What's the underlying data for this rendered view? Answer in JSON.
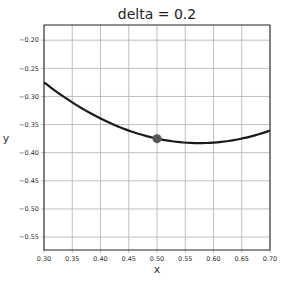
{
  "chart_data": {
    "type": "line",
    "title": "delta = 0.2",
    "xlabel": "x",
    "ylabel": "y",
    "xlim": [
      0.3,
      0.7
    ],
    "ylim": [
      -0.573,
      -0.173
    ],
    "grid": true,
    "xticks": [
      "0.30",
      "0.35",
      "0.40",
      "0.45",
      "0.50",
      "0.55",
      "0.60",
      "0.65",
      "0.70"
    ],
    "yticks": [
      "-0.20",
      "-0.25",
      "-0.30",
      "-0.35",
      "-0.40",
      "-0.45",
      "-0.50",
      "-0.55"
    ],
    "series": [
      {
        "name": "curve",
        "color": "#1a1a1a",
        "x": [
          0.3,
          0.35,
          0.4,
          0.45,
          0.5,
          0.55,
          0.575,
          0.6,
          0.65,
          0.7
        ],
        "y": [
          -0.275,
          -0.309,
          -0.339,
          -0.36,
          -0.375,
          -0.382,
          -0.383,
          -0.382,
          -0.375,
          -0.359
        ]
      }
    ],
    "marker": {
      "x": 0.5,
      "y": -0.375,
      "color": "#555555"
    }
  }
}
